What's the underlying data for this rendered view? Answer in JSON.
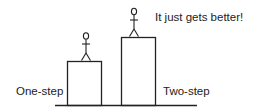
{
  "diagram": {
    "labels": {
      "left_step": "One-step",
      "right_step": "Two-step",
      "caption": "It just gets better!"
    },
    "steps": [
      {
        "name": "one-step",
        "height": "short"
      },
      {
        "name": "two-step",
        "height": "tall"
      }
    ],
    "colors": {
      "stroke": "#222222",
      "background": "#ffffff"
    }
  }
}
